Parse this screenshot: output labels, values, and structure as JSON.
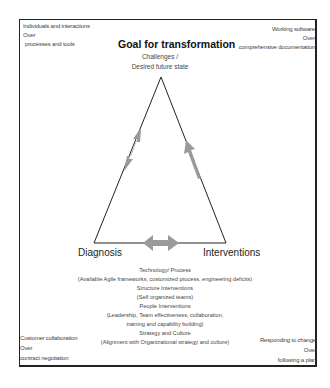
{
  "corners": {
    "top_left": [
      "Individuals and interactions",
      "Over",
      "processes and tools"
    ],
    "top_right": [
      "Working software",
      "Over",
      "comprehensive documentation"
    ],
    "bottom_left": [
      "Customer collaboration",
      "Over",
      "contract negotiation"
    ],
    "bottom_right": [
      "Responding to change",
      "Over",
      "following a plan"
    ]
  },
  "title": "Goal for transformation",
  "subtitle": [
    "Challenges /",
    "Desired future state"
  ],
  "vertices": {
    "left": "Diagnosis",
    "right": "Interventions"
  },
  "details": [
    "Technology/ Process",
    "(Available Agile frameworks, customized process, engineering deficits)",
    "Structure Interventions",
    "(Self organized teams)",
    "People Interventions",
    "(Leadership, Team effectiveness, collaboration,",
    "training and capability building)",
    "Strategy and Culture",
    "(Alignment with Organizational strategy and culture)"
  ],
  "colors": {
    "arrow": "#9a9a9a",
    "line": "#222222",
    "text": "#444444"
  }
}
